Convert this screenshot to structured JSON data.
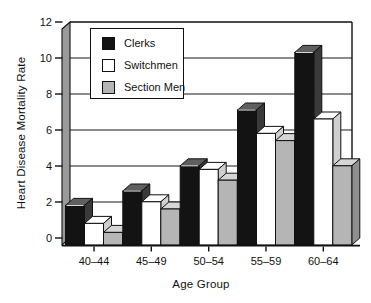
{
  "chart_data": {
    "type": "bar",
    "style": "3d-grouped",
    "title": "",
    "xlabel": "Age Group",
    "ylabel": "Heart Disease Mortality Rate",
    "categories": [
      "40–44",
      "45–49",
      "50–54",
      "55–59",
      "60–64"
    ],
    "series": [
      {
        "name": "Clerks",
        "values": [
          2.2,
          3.0,
          4.4,
          7.5,
          10.7
        ],
        "front": "#131313",
        "top": "#5f5f5f",
        "side": "#3a3a3a"
      },
      {
        "name": "Switchmen",
        "values": [
          1.2,
          2.4,
          4.2,
          6.2,
          7.0
        ],
        "front": "#ffffff",
        "top": "#ffffff",
        "side": "#cfcfcf"
      },
      {
        "name": "Section Men",
        "values": [
          0.7,
          2.0,
          3.6,
          5.8,
          4.4
        ],
        "front": "#b5b5b5",
        "top": "#d5d5d5",
        "side": "#8f8f8f"
      }
    ],
    "ylim": [
      0,
      12
    ],
    "yticks": [
      0,
      2,
      4,
      6,
      8,
      10,
      12
    ],
    "grid": true,
    "legend_position": "top-left-inside",
    "colors": {
      "axis": "#111111",
      "gridline": "#1a1a1a",
      "wall_side": "#9a9a9a",
      "background": "#ffffff"
    }
  }
}
